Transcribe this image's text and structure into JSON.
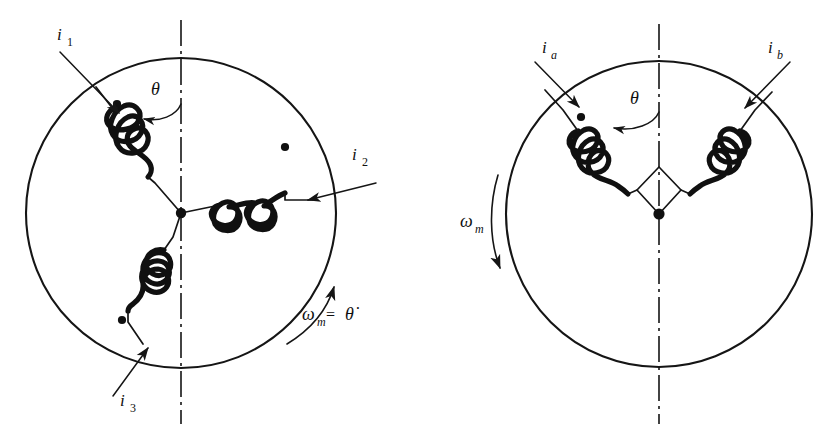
{
  "figure": {
    "kind": "electric-machine-winding-diagram",
    "panel_count": 2,
    "stroke_color": "#151515",
    "coil_color": "#101010",
    "background_color": "#ffffff"
  },
  "left_panel": {
    "name": "three-phase-wye-machine",
    "circle": {
      "cx": 181,
      "cy": 213,
      "r": 155
    },
    "center_junction": {
      "cx": 181,
      "cy": 213
    },
    "axis_label": "vertical-dash-dot-axis",
    "theta": {
      "label": "θ",
      "x": 151,
      "y": 95
    },
    "omega": {
      "symbol": "ω",
      "subscript": "m",
      "equals": "=",
      "rate": "θ̇",
      "full": "ωm = θ̇",
      "x": 311,
      "y": 313,
      "direction": "counterclockwise-up-right"
    },
    "currents": [
      {
        "name": "i1",
        "symbol": "i",
        "subscript": "1",
        "label_x": 57,
        "label_y": 40,
        "direction": "into-circle-upper-left"
      },
      {
        "name": "i2",
        "symbol": "i",
        "subscript": "2",
        "label_x": 352,
        "label_y": 160,
        "direction": "into-circle-right"
      },
      {
        "name": "i3",
        "symbol": "i",
        "subscript": "3",
        "label_x": 120,
        "label_y": 406,
        "direction": "into-circle-lower-left"
      }
    ],
    "coils": [
      {
        "name": "coil-phase-1",
        "position": "upper-left",
        "polarity_dot": {
          "cx": 117,
          "cy": 104
        }
      },
      {
        "name": "coil-phase-2",
        "position": "right",
        "polarity_dot": {
          "cx": 285,
          "cy": 147
        }
      },
      {
        "name": "coil-phase-3",
        "position": "lower-left",
        "polarity_dot": {
          "cx": 122,
          "cy": 320
        }
      }
    ]
  },
  "right_panel": {
    "name": "two-phase-machine",
    "circle": {
      "cx": 659,
      "cy": 214,
      "r": 153
    },
    "center_junction": {
      "cx": 659,
      "cy": 214
    },
    "axis_label": "vertical-dash-dot-axis",
    "theta": {
      "label": "θ",
      "x": 633,
      "y": 104
    },
    "omega": {
      "symbol": "ω",
      "subscript": "m",
      "full": "ωm",
      "x": 467,
      "y": 227,
      "direction": "clockwise-down-left"
    },
    "currents": [
      {
        "name": "ia",
        "symbol": "i",
        "subscript": "a",
        "label_x": 545,
        "label_y": 53,
        "direction": "into-circle-upper-left"
      },
      {
        "name": "ib",
        "symbol": "i",
        "subscript": "b",
        "label_x": 771,
        "label_y": 53,
        "direction": "into-circle-upper-right"
      }
    ],
    "coils": [
      {
        "name": "coil-phase-a",
        "position": "upper-left",
        "polarity_dot": {
          "cx": 581,
          "cy": 117
        }
      },
      {
        "name": "coil-phase-b",
        "position": "upper-right",
        "polarity_dot": {
          "cx": 747,
          "cy": 140
        }
      }
    ]
  }
}
